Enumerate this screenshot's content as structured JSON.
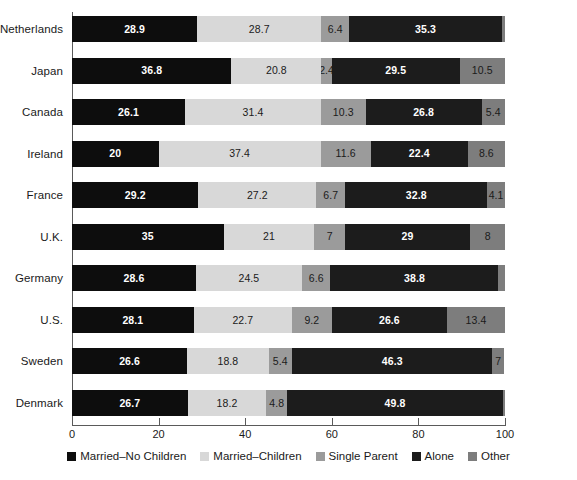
{
  "chart_data": {
    "type": "bar",
    "subtype": "stacked-horizontal-bar-100pct",
    "title": "",
    "xlabel": "",
    "ylabel": "",
    "xlim": [
      0,
      100
    ],
    "grid": false,
    "legend_position": "bottom",
    "categories": [
      "Netherlands",
      "Japan",
      "Canada",
      "Ireland",
      "France",
      "U.K.",
      "Germany",
      "U.S.",
      "Sweden",
      "Denmark"
    ],
    "xticks": [
      0,
      20,
      40,
      60,
      80,
      100
    ],
    "xtick_labels": [
      "0",
      "20",
      "40",
      "60",
      "80",
      "100"
    ],
    "series": [
      {
        "name": "Married–No Children",
        "color": "#0d0d0d",
        "values": [
          28.9,
          36.8,
          26.1,
          20,
          29.2,
          35,
          28.6,
          28.1,
          26.6,
          26.7
        ],
        "labels": [
          "28.9",
          "36.8",
          "26.1",
          "20",
          "29.2",
          "35",
          "28.6",
          "28.1",
          "26.6",
          "26.7"
        ]
      },
      {
        "name": "Married–Children",
        "color": "#d8d8d8",
        "values": [
          28.7,
          20.8,
          31.4,
          37.4,
          27.2,
          21,
          24.5,
          22.7,
          18.8,
          18.2
        ],
        "labels": [
          "28.7",
          "20.8",
          "31.4",
          "37.4",
          "27.2",
          "21",
          "24.5",
          "22.7",
          "18.8",
          "18.2"
        ]
      },
      {
        "name": "Single Parent",
        "color": "#9b9b9b",
        "values": [
          6.4,
          2.4,
          10.3,
          11.6,
          6.7,
          7,
          6.6,
          9.2,
          5.4,
          4.8
        ],
        "labels": [
          "6.4",
          "2.4",
          "10.3",
          "11.6",
          "6.7",
          "7",
          "6.6",
          "9.2",
          "5.4",
          "4.8"
        ]
      },
      {
        "name": "Alone",
        "color": "#1c1c1c",
        "values": [
          35.3,
          29.5,
          26.8,
          22.4,
          32.8,
          29,
          38.8,
          26.6,
          46.3,
          49.8
        ],
        "labels": [
          "35.3",
          "29.5",
          "26.8",
          "22.4",
          "32.8",
          "29",
          "38.8",
          "26.6",
          "46.3",
          "49.8"
        ]
      },
      {
        "name": "Other",
        "color": "#7d7d7d",
        "values": [
          0.7,
          10.5,
          5.4,
          8.6,
          4.1,
          8,
          1.5,
          13.4,
          2.7,
          0.5
        ],
        "labels": [
          "",
          "10.5",
          "5.4",
          "8.6",
          "4.1",
          "8",
          "",
          "13.4",
          "7",
          ""
        ]
      }
    ]
  },
  "legend": {
    "items": [
      {
        "label": "Married–No Children",
        "color": "#0d0d0d",
        "icon": "square-swatch-icon"
      },
      {
        "label": "Married–Children",
        "color": "#d8d8d8",
        "icon": "square-swatch-icon"
      },
      {
        "label": "Single Parent",
        "color": "#9b9b9b",
        "icon": "square-swatch-icon"
      },
      {
        "label": "Alone",
        "color": "#1c1c1c",
        "icon": "square-swatch-icon"
      },
      {
        "label": "Other",
        "color": "#7d7d7d",
        "icon": "square-swatch-icon"
      }
    ]
  }
}
